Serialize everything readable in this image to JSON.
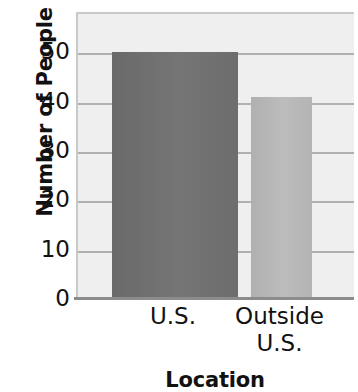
{
  "chart_data": {
    "type": "bar",
    "title": "",
    "xlabel": "Location",
    "ylabel": "Number of People",
    "categories": [
      "U.S.",
      "Outside U.S."
    ],
    "values": [
      50,
      41
    ],
    "ylim": [
      0,
      58
    ],
    "yticks": [
      0,
      10,
      20,
      30,
      40,
      50
    ],
    "ytick_labels": [
      "0",
      "10",
      "20",
      "30",
      "40",
      "50"
    ],
    "grid": true,
    "grid_axis": "y",
    "legend": "none",
    "bars": [
      {
        "category_line1": "U.S.",
        "category_line2": "",
        "value": 50,
        "color": "#6e6e6e",
        "x_left_px": 110,
        "x_right_px": 236
      },
      {
        "category_line1": "Outside",
        "category_line2": "U.S.",
        "value": 41,
        "color": "#b5b5b5",
        "x_left_px": 249,
        "x_right_px": 310
      }
    ],
    "colors": {
      "bar_dark": "#6e6e6e",
      "bar_light": "#b5b5b5",
      "plot_background": "#efefef",
      "gridline": "#b0b0b0",
      "axis_line": "#8c8c8c",
      "text": "#111111",
      "page_background": "#ffffff"
    }
  }
}
